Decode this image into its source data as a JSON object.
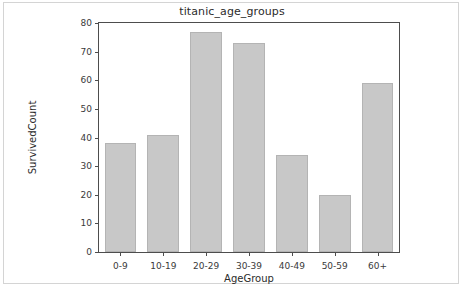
{
  "figure": {
    "background": "#ffffff",
    "border_color": "#d4d4d4"
  },
  "chart_data": {
    "type": "bar",
    "title": "titanic_age_groups",
    "xlabel": "AgeGroup",
    "ylabel": "SurvivedCount",
    "categories": [
      "0-9",
      "10-19",
      "20-29",
      "30-39",
      "40-49",
      "50-59",
      "60+"
    ],
    "values": [
      38,
      41,
      77,
      73,
      34,
      20,
      59
    ],
    "series": [
      {
        "name": "SurvivedCount",
        "values": [
          38,
          41,
          77,
          73,
          34,
          20,
          59
        ]
      }
    ],
    "ylim": [
      0,
      80
    ],
    "yticks": [
      0,
      10,
      20,
      30,
      40,
      50,
      60,
      70,
      80
    ],
    "ytick_labels": [
      "0",
      "10",
      "20",
      "30",
      "40",
      "50",
      "60",
      "70",
      "80"
    ],
    "grid": false,
    "legend": false,
    "legend_position": "none",
    "bar_color": "#c8c8c8",
    "bar_edge_color": "#b4b4b4",
    "axis_color": "#4d4d4d",
    "text_color": "#2b2b2b"
  }
}
